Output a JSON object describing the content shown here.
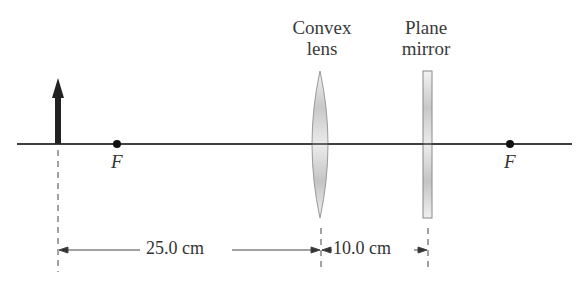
{
  "diagram": {
    "labels": {
      "lens": [
        "Convex",
        "lens"
      ],
      "mirror": [
        "Plane",
        "mirror"
      ],
      "focal_left": "F",
      "focal_right": "F"
    },
    "dimensions": {
      "object_to_lens": "25.0 cm",
      "lens_to_mirror": "10.0 cm"
    },
    "elements": [
      "object arrow",
      "convex lens",
      "plane mirror",
      "optical axis",
      "focal points"
    ]
  }
}
